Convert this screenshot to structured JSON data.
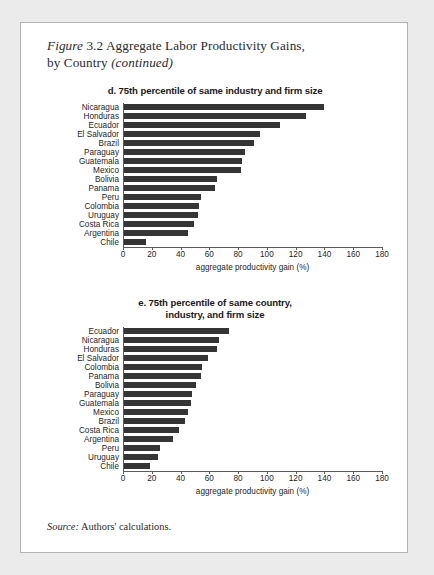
{
  "figure": {
    "label_italic": "Figure",
    "number": "3.2",
    "title_main": "Aggregate Labor Productivity Gains,",
    "title_line2": "by Country",
    "continued": "(continued)"
  },
  "source": {
    "prefix": "Source:",
    "text": "Authors' calculations."
  },
  "axis": {
    "xlabel": "aggregate productivity gain (%)",
    "ticks": [
      0,
      20,
      40,
      60,
      80,
      100,
      120,
      140,
      160,
      180
    ]
  },
  "chart_data": [
    {
      "id": "d",
      "type": "bar",
      "orientation": "horizontal",
      "title": "d. 75th percentile of same industry and firm size",
      "title_lines": [
        "d. 75th percentile of same industry and firm size"
      ],
      "xlabel": "aggregate productivity gain (%)",
      "ylabel": "",
      "xlim": [
        0,
        180
      ],
      "xticks": [
        0,
        20,
        40,
        60,
        80,
        100,
        120,
        140,
        160,
        180
      ],
      "grid": false,
      "legend": false,
      "categories": [
        "Nicaragua",
        "Honduras",
        "Ecuador",
        "El Salvador",
        "Brazil",
        "Paraguay",
        "Guatemala",
        "Mexico",
        "Bolivia",
        "Panama",
        "Peru",
        "Colombia",
        "Uruguay",
        "Costa Rica",
        "Argentina",
        "Chile"
      ],
      "values": [
        140,
        127,
        109,
        95,
        91,
        85,
        83,
        82,
        65,
        64,
        54,
        53,
        52,
        49,
        45,
        16
      ]
    },
    {
      "id": "e",
      "type": "bar",
      "orientation": "horizontal",
      "title": "e. 75th percentile of same country, industry, and firm size",
      "title_lines": [
        "e. 75th percentile of same country,",
        "industry, and firm size"
      ],
      "xlabel": "aggregate productivity gain (%)",
      "ylabel": "",
      "xlim": [
        0,
        180
      ],
      "xticks": [
        0,
        20,
        40,
        60,
        80,
        100,
        120,
        140,
        160,
        180
      ],
      "grid": false,
      "legend": false,
      "categories": [
        "Ecuador",
        "Nicaragua",
        "Honduras",
        "El Salvador",
        "Colombia",
        "Panama",
        "Bolivia",
        "Paraguay",
        "Guatemala",
        "Mexico",
        "Brazil",
        "Costa Rica",
        "Argentina",
        "Peru",
        "Uruguay",
        "Chile"
      ],
      "values": [
        74,
        67,
        65,
        59,
        55,
        54,
        51,
        48,
        47,
        45,
        43,
        39,
        35,
        26,
        24,
        19
      ]
    }
  ],
  "colors": {
    "bar": "#353535",
    "axis": "#5a5a5a",
    "page": "#ffffff",
    "border": "#b4b4b4",
    "text": "#262626"
  }
}
